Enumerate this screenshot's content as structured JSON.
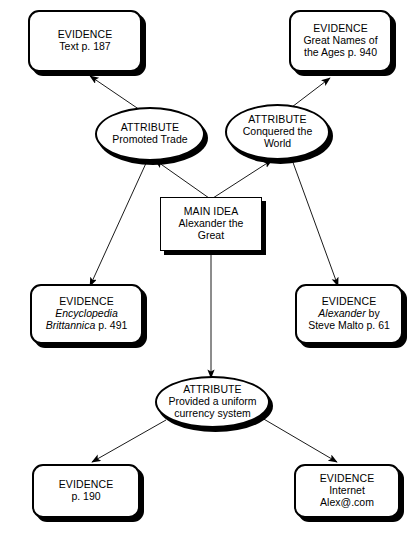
{
  "diagram": {
    "type": "main-idea-evidence-web",
    "stroke_color": "#000000",
    "fill_color": "#ffffff",
    "nodes": [
      {
        "id": "evidence_text",
        "shape": "rounded-rect",
        "kind": "EVIDENCE",
        "lines": [
          "Text p. 187"
        ]
      },
      {
        "id": "evidence_great_names",
        "shape": "rounded-rect",
        "kind": "EVIDENCE",
        "lines": [
          "Great Names of",
          "the Ages p. 940"
        ]
      },
      {
        "id": "attribute_trade",
        "shape": "ellipse",
        "kind": "ATTRIBUTE",
        "lines": [
          "Promoted Trade"
        ]
      },
      {
        "id": "attribute_conquered",
        "shape": "ellipse",
        "kind": "ATTRIBUTE",
        "lines": [
          "Conquered the",
          "World"
        ]
      },
      {
        "id": "main_idea",
        "shape": "rect",
        "kind": "MAIN IDEA",
        "lines": [
          "Alexander the",
          "Great"
        ]
      },
      {
        "id": "evidence_encyclopedia",
        "shape": "rounded-rect",
        "kind": "EVIDENCE",
        "lines": [
          "Encyclopedia",
          "Brittannica p. 491"
        ]
      },
      {
        "id": "evidence_alexander_book",
        "shape": "rounded-rect",
        "kind": "EVIDENCE",
        "lines": [
          "Alexander by",
          "Steve Malto p. 61"
        ]
      },
      {
        "id": "attribute_currency",
        "shape": "ellipse",
        "kind": "ATTRIBUTE",
        "lines": [
          "Provided a uniform",
          "currency system"
        ]
      },
      {
        "id": "evidence_p190",
        "shape": "rounded-rect",
        "kind": "EVIDENCE",
        "lines": [
          "p. 190"
        ]
      },
      {
        "id": "evidence_internet",
        "shape": "rounded-rect",
        "kind": "EVIDENCE",
        "lines": [
          "Internet",
          "Alex@.com"
        ]
      }
    ],
    "edges": [
      {
        "from": "main_idea",
        "to": "attribute_trade"
      },
      {
        "from": "main_idea",
        "to": "attribute_conquered"
      },
      {
        "from": "main_idea",
        "to": "attribute_currency"
      },
      {
        "from": "attribute_trade",
        "to": "evidence_text"
      },
      {
        "from": "attribute_trade",
        "to": "evidence_encyclopedia"
      },
      {
        "from": "attribute_conquered",
        "to": "evidence_great_names"
      },
      {
        "from": "attribute_conquered",
        "to": "evidence_alexander_book"
      },
      {
        "from": "attribute_currency",
        "to": "evidence_p190"
      },
      {
        "from": "attribute_currency",
        "to": "evidence_internet"
      }
    ]
  },
  "nodes": {
    "evidence_text": {
      "kind": "EVIDENCE",
      "line1": "Text p. 187"
    },
    "evidence_great_names": {
      "kind": "EVIDENCE",
      "line1": "Great Names of",
      "line2": "the Ages p. 940"
    },
    "attribute_trade": {
      "kind": "ATTRIBUTE",
      "line1": "Promoted Trade"
    },
    "attribute_conquered": {
      "kind": "ATTRIBUTE",
      "line1": "Conquered the",
      "line2": "World"
    },
    "main_idea": {
      "kind": "MAIN IDEA",
      "line1": "Alexander the",
      "line2": "Great"
    },
    "evidence_encyclopedia": {
      "kind": "EVIDENCE",
      "line1_italic": "Encyclopedia",
      "line2_italic": "Brittannica",
      "line2_rest": " p. 491"
    },
    "evidence_alexander_book": {
      "kind": "EVIDENCE",
      "line1_italic": "Alexander",
      "line1_rest": " by",
      "line2": "Steve Malto p. 61"
    },
    "attribute_currency": {
      "kind": "ATTRIBUTE",
      "line1": "Provided a uniform",
      "line2": "currency system"
    },
    "evidence_p190": {
      "kind": "EVIDENCE",
      "line1": "p. 190"
    },
    "evidence_internet": {
      "kind": "EVIDENCE",
      "line1": "Internet",
      "line2": "Alex@.com"
    }
  }
}
